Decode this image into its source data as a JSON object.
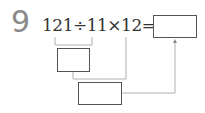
{
  "problem": {
    "number": "9",
    "expression": "121÷11×12=",
    "answer_box_value": "",
    "step1_box_value": "",
    "step2_box_value": ""
  },
  "colors": {
    "number": "#8a8a8a",
    "text": "#333333",
    "box_border": "#555555",
    "connector": "#b0b0b0"
  }
}
